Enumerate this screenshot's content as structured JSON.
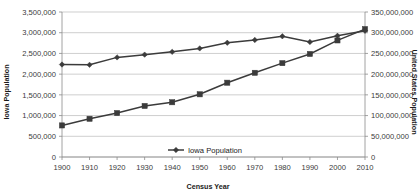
{
  "chart_data": {
    "type": "line",
    "title": "",
    "xlabel": "Census Year",
    "ylabel": "Iowa Population",
    "y2label": "United States Population",
    "grid": true,
    "legend_position": "bottom-center-inside",
    "x": [
      1900,
      1910,
      1920,
      1930,
      1940,
      1950,
      1960,
      1970,
      1980,
      1990,
      2000,
      2010
    ],
    "xtick_labels": [
      "1900",
      "1910",
      "1920",
      "1930",
      "1940",
      "1950",
      "1960",
      "1970",
      "1980",
      "1990",
      "2000",
      "2010"
    ],
    "ylim": [
      0,
      3500000
    ],
    "ytick_labels": [
      "0",
      "500,000",
      "1,000,000",
      "1,500,000",
      "2,000,000",
      "2,500,000",
      "3,000,000",
      "3,500,000"
    ],
    "ytick_values": [
      0,
      500000,
      1000000,
      1500000,
      2000000,
      2500000,
      3000000,
      3500000
    ],
    "y2lim": [
      0,
      350000000
    ],
    "y2tick_labels": [
      "0",
      "50,000,000",
      "100,000,000",
      "150,000,000",
      "200,000,000",
      "250,000,000",
      "300,000,000",
      "350,000,000"
    ],
    "y2tick_values": [
      0,
      50000000,
      100000000,
      150000000,
      200000000,
      250000000,
      300000000,
      350000000
    ],
    "series": [
      {
        "name": "Iowa Population",
        "axis": "left",
        "marker": "diamond",
        "in_legend": true,
        "values": [
          2231853,
          2224771,
          2404021,
          2470939,
          2538268,
          2621073,
          2757537,
          2825368,
          2913808,
          2776755,
          2926324,
          3046355
        ]
      },
      {
        "name": "United States Population",
        "axis": "right",
        "marker": "square",
        "in_legend": false,
        "values": [
          76212168,
          92228496,
          106021537,
          123202624,
          132164569,
          151325798,
          179323175,
          203211926,
          226545805,
          248709873,
          281421906,
          308745538
        ]
      }
    ],
    "legend_entries": [
      {
        "label": "Iowa Population",
        "marker": "diamond"
      }
    ],
    "colors": {
      "series_stroke": "#3b3b3b",
      "gridline": "#b9b9b9",
      "axis": "#8c8c8c",
      "text": "#1a1a1a",
      "background": "#ffffff"
    }
  }
}
